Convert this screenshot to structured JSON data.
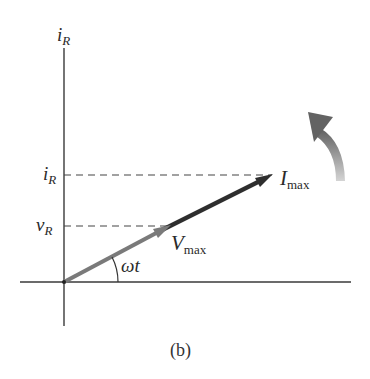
{
  "figure": {
    "caption": "(b)",
    "axes": {
      "vertical_label": {
        "main": "i",
        "sub": "R"
      },
      "horizontal_label": ""
    },
    "tick_labels": [
      {
        "id": "current",
        "main": "i",
        "sub": "R"
      },
      {
        "id": "voltage",
        "main": "v",
        "sub": "R"
      }
    ],
    "phasors": [
      {
        "id": "voltage-phasor",
        "main": "V",
        "sub": "max",
        "color": "#777777"
      },
      {
        "id": "current-phasor",
        "main": "I",
        "sub": "max",
        "color": "#333333"
      }
    ],
    "angle_label": "ωt",
    "rotation_indicator": "counterclockwise",
    "colors": {
      "axis": "#3a3a3a",
      "dashed": "#444444",
      "voltage_phasor": "#7a7a7a",
      "current_phasor": "#2e2e2e",
      "rotation_arrow_dark": "#6a6a6a",
      "rotation_arrow_light": "#cfcfcf"
    }
  }
}
